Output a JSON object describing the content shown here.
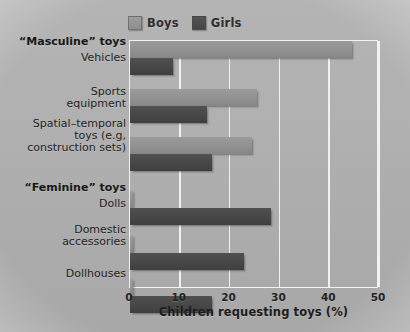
{
  "chart_data": {
    "type": "bar",
    "orientation": "horizontal",
    "title": "",
    "xlabel": "Children requesting toys (%)",
    "ylabel": "",
    "xlim": [
      0,
      50
    ],
    "xticks": [
      0,
      10,
      20,
      30,
      40,
      50
    ],
    "grid": true,
    "legend_position": "top-left",
    "group_headings": [
      "“Masculine” toys",
      "“Feminine” toys"
    ],
    "categories": [
      "Vehicles",
      "Sports equipment",
      "Spatial–temporal toys (e.g, construction sets)",
      "Dolls",
      "Domestic accessories",
      "Dollhouses"
    ],
    "series": [
      {
        "name": "Boys",
        "color": "#919191",
        "values": [
          44.5,
          25.5,
          24.5,
          0.6,
          0.6,
          0.6
        ]
      },
      {
        "name": "Girls",
        "color": "#474747",
        "values": [
          8.6,
          15.5,
          16.5,
          28.3,
          22.9,
          16.5
        ]
      }
    ]
  },
  "legend": {
    "items": [
      {
        "label": "Boys",
        "swatch": "boys-swatch"
      },
      {
        "label": "Girls",
        "swatch": "girls-swatch"
      }
    ]
  },
  "axis": {
    "x_title": "Children requesting toys (%)",
    "x_tick_labels": [
      "0",
      "10",
      "20",
      "30",
      "40",
      "50"
    ]
  },
  "y_axis_labels": [
    {
      "text": "“Masculine” toys",
      "kind": "group"
    },
    {
      "text": "Vehicles",
      "kind": "category"
    },
    {
      "text": "Sports",
      "kind": "category"
    },
    {
      "text": "equipment",
      "kind": "category"
    },
    {
      "text": "Spatial–temporal",
      "kind": "category"
    },
    {
      "text": "toys (e.g,",
      "kind": "category"
    },
    {
      "text": "construction sets)",
      "kind": "category"
    },
    {
      "text": "“Feminine” toys",
      "kind": "group"
    },
    {
      "text": "Dolls",
      "kind": "category"
    },
    {
      "text": "Domestic",
      "kind": "category"
    },
    {
      "text": "accessories",
      "kind": "category"
    },
    {
      "text": "Dollhouses",
      "kind": "category"
    }
  ]
}
